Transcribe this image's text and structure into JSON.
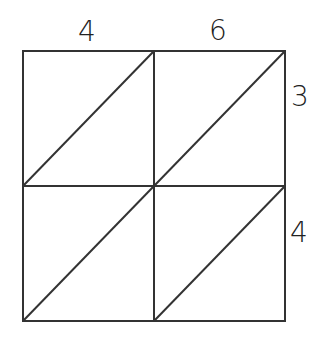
{
  "diagram": {
    "type": "lattice-multiplication-grid",
    "top_digits": [
      "4",
      "6"
    ],
    "right_digits": [
      "3",
      "4"
    ],
    "rows": 2,
    "cols": 2,
    "line_color": "#333333",
    "background": "#ffffff"
  }
}
